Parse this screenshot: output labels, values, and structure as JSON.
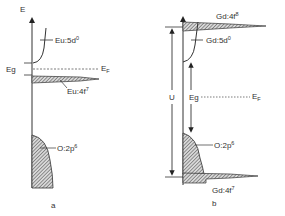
{
  "diagram": {
    "type": "energy-level-diagram",
    "panels": [
      {
        "id": "a",
        "caption": "a",
        "axis_label": "E",
        "levels": {
          "conduction": {
            "label": "Eu:5d",
            "sup": "0"
          },
          "occupied_f": {
            "label": "Eu:4f",
            "sup": "7"
          },
          "valence": {
            "label": "O:2p",
            "sup": "6"
          },
          "gap": "Eg",
          "fermi": {
            "label": "E",
            "sub": "F"
          }
        }
      },
      {
        "id": "b",
        "caption": "b",
        "levels": {
          "upper_f": {
            "label": "Gd:4f",
            "sup": "8"
          },
          "conduction": {
            "label": "Gd:5d",
            "sup": "0"
          },
          "valence": {
            "label": "O:2p",
            "sup": "6"
          },
          "lower_f": {
            "label": "Gd:4f",
            "sup": "7"
          },
          "hubbard": "U",
          "gap": "Eg",
          "fermi": {
            "label": "E",
            "sub": "F"
          }
        }
      }
    ]
  },
  "colors": {
    "line": "#333333",
    "hatch": "#555555",
    "background": "#ffffff"
  }
}
